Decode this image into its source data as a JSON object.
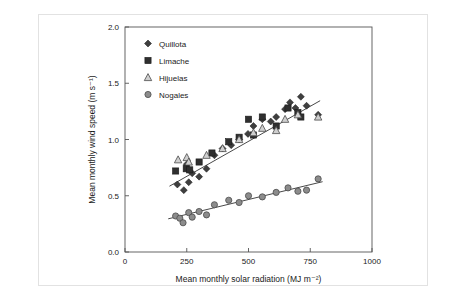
{
  "chart_data": {
    "type": "scatter",
    "title": "",
    "xlabel": "Mean monthly solar radiation (MJ m⁻²)",
    "ylabel": "Mean monthly wind speed (m s⁻¹)",
    "xlim": [
      0,
      1000
    ],
    "ylim": [
      0.0,
      2.0
    ],
    "xticks": [
      0,
      250,
      500,
      750,
      1000
    ],
    "xtick_labels": [
      "0",
      "250",
      "500",
      "750",
      "1000"
    ],
    "yticks": [
      0.0,
      0.5,
      1.0,
      1.5,
      2.0
    ],
    "ytick_labels": [
      "0.0",
      "0.5",
      "1.0",
      "1.5",
      "2.0"
    ],
    "grid": false,
    "legend_position": "top-left",
    "legend": [
      {
        "name": "Quillota",
        "marker": "diamond",
        "color": "#3f3f3f"
      },
      {
        "name": "Limache",
        "marker": "square",
        "color": "#2f2f2f"
      },
      {
        "name": "Hijuelas",
        "marker": "triangle",
        "color": "#9a9a9a"
      },
      {
        "name": "Nogales",
        "marker": "circle",
        "color": "#8c8c8c"
      }
    ],
    "series": [
      {
        "name": "Quillota",
        "marker": "diamond",
        "color": "#3f3f3f",
        "points": [
          [
            212,
            0.6
          ],
          [
            238,
            0.55
          ],
          [
            250,
            0.78
          ],
          [
            258,
            0.62
          ],
          [
            272,
            0.7
          ],
          [
            300,
            0.67
          ],
          [
            330,
            0.74
          ],
          [
            362,
            0.86
          ],
          [
            395,
            0.92
          ],
          [
            430,
            0.95
          ],
          [
            462,
            1.0
          ],
          [
            498,
            1.05
          ],
          [
            520,
            1.12
          ],
          [
            556,
            1.18
          ],
          [
            590,
            1.16
          ],
          [
            612,
            1.2
          ],
          [
            648,
            1.27
          ],
          [
            668,
            1.33
          ],
          [
            690,
            1.28
          ],
          [
            712,
            1.38
          ],
          [
            735,
            1.3
          ],
          [
            782,
            1.22
          ]
        ]
      },
      {
        "name": "Limache",
        "marker": "square",
        "color": "#2f2f2f",
        "points": [
          [
            205,
            0.72
          ],
          [
            248,
            0.74
          ],
          [
            262,
            0.73
          ],
          [
            300,
            0.8
          ],
          [
            352,
            0.88
          ],
          [
            420,
            0.98
          ],
          [
            462,
            1.02
          ],
          [
            500,
            1.18
          ],
          [
            520,
            1.04
          ],
          [
            556,
            1.2
          ],
          [
            612,
            1.12
          ],
          [
            660,
            1.28
          ],
          [
            700,
            1.24
          ],
          [
            712,
            1.2
          ]
        ]
      },
      {
        "name": "Hijuelas",
        "marker": "triangle",
        "color": "#9a9a9a",
        "points": [
          [
            215,
            0.82
          ],
          [
            250,
            0.84
          ],
          [
            258,
            0.8
          ],
          [
            330,
            0.86
          ],
          [
            395,
            0.92
          ],
          [
            462,
            1.0
          ],
          [
            520,
            1.06
          ],
          [
            556,
            1.1
          ],
          [
            612,
            1.08
          ],
          [
            648,
            1.18
          ],
          [
            700,
            1.22
          ],
          [
            782,
            1.2
          ]
        ]
      },
      {
        "name": "Nogales",
        "marker": "circle",
        "color": "#8c8c8c",
        "points": [
          [
            205,
            0.32
          ],
          [
            222,
            0.3
          ],
          [
            235,
            0.26
          ],
          [
            258,
            0.35
          ],
          [
            272,
            0.31
          ],
          [
            300,
            0.36
          ],
          [
            330,
            0.33
          ],
          [
            362,
            0.42
          ],
          [
            420,
            0.46
          ],
          [
            462,
            0.44
          ],
          [
            500,
            0.5
          ],
          [
            556,
            0.49
          ],
          [
            612,
            0.53
          ],
          [
            660,
            0.57
          ],
          [
            700,
            0.54
          ],
          [
            735,
            0.55
          ],
          [
            782,
            0.65
          ]
        ]
      }
    ],
    "trend_lines": [
      {
        "name": "upper-trend",
        "x1": 180,
        "y1": 0.585,
        "x2": 790,
        "y2": 1.345
      },
      {
        "name": "nogales-trend",
        "x1": 175,
        "y1": 0.295,
        "x2": 800,
        "y2": 0.625
      }
    ]
  }
}
